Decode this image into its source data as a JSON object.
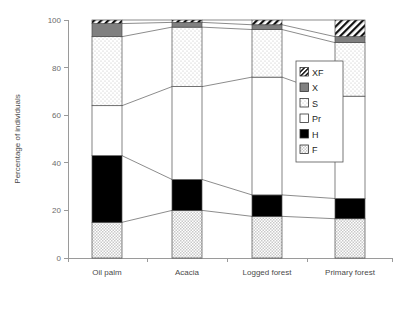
{
  "chart_data": {
    "type": "bar",
    "subtype": "stacked-percentage",
    "title": "",
    "xlabel": "",
    "ylabel": "Percentage of individuals",
    "ylim": [
      0,
      100
    ],
    "yticks": [
      0,
      20,
      40,
      60,
      80,
      100
    ],
    "ytick_labels": [
      "0",
      "20",
      "40",
      "60",
      "80",
      "100"
    ],
    "grid": false,
    "legend_position": "inside-right",
    "categories": [
      "Oil palm",
      "Acacia",
      "Logged forest",
      "Primary forest"
    ],
    "series": [
      {
        "name": "F",
        "label": "F",
        "pattern": "fine-dots",
        "color": "#e8e8e8",
        "values": [
          15.0,
          20.0,
          17.5,
          16.5
        ]
      },
      {
        "name": "H",
        "label": "H",
        "pattern": "solid",
        "color": "#000000",
        "values": [
          28.0,
          13.0,
          9.0,
          8.5
        ]
      },
      {
        "name": "Pr",
        "label": "Pr",
        "pattern": "plain-white",
        "color": "#ffffff",
        "values": [
          21.0,
          39.0,
          49.5,
          43.0
        ]
      },
      {
        "name": "S",
        "label": "S",
        "pattern": "sparse-dots",
        "color": "#f2f2f2",
        "values": [
          29.0,
          25.0,
          20.0,
          22.5
        ]
      },
      {
        "name": "X",
        "label": "X",
        "pattern": "solid-gray",
        "color": "#808080",
        "values": [
          5.5,
          2.0,
          2.0,
          2.5
        ]
      },
      {
        "name": "XF",
        "label": "XF",
        "pattern": "diagonal-hatch",
        "color": "#ffffff",
        "values": [
          1.5,
          1.0,
          2.0,
          7.0
        ]
      }
    ],
    "cumulative_tops": {
      "Oil palm": {
        "F": 15.0,
        "H": 43.0,
        "Pr": 64.0,
        "S": 93.0,
        "X": 98.5,
        "XF": 100.0
      },
      "Acacia": {
        "F": 20.0,
        "H": 33.0,
        "Pr": 72.0,
        "S": 97.0,
        "X": 99.0,
        "XF": 100.0
      },
      "Logged forest": {
        "F": 17.5,
        "H": 26.5,
        "Pr": 76.0,
        "S": 96.0,
        "X": 98.0,
        "XF": 100.0
      },
      "Primary forest": {
        "F": 16.5,
        "H": 25.0,
        "Pr": 68.0,
        "S": 90.5,
        "X": 93.0,
        "XF": 100.0
      }
    },
    "legend_entries": [
      {
        "label": "XF",
        "pattern": "diagonal-hatch"
      },
      {
        "label": "X",
        "pattern": "solid-gray"
      },
      {
        "label": "S",
        "pattern": "sparse-dots"
      },
      {
        "label": "Pr",
        "pattern": "plain-white"
      },
      {
        "label": "H",
        "pattern": "solid"
      },
      {
        "label": "F",
        "pattern": "fine-dots"
      }
    ],
    "colors": {
      "black": "#000000",
      "gray": "#808080",
      "white": "#ffffff",
      "axis": "#9a9a9a",
      "text": "#4a4a4a"
    }
  }
}
